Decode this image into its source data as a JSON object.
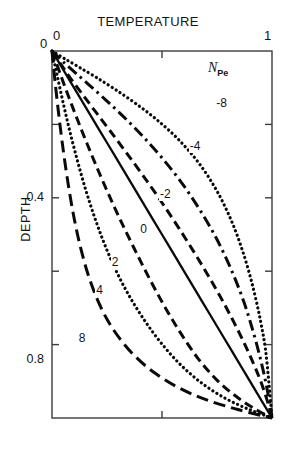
{
  "chart_data": {
    "type": "line",
    "title": "TEMPERATURE",
    "xlabel": "TEMPERATURE",
    "ylabel": "DEPTH",
    "xlim": [
      0,
      1
    ],
    "ylim": [
      0,
      1
    ],
    "x_ticks": [
      "0",
      "1"
    ],
    "x_tick_values": [
      0,
      1
    ],
    "x_minor_tick_values": [
      0.5
    ],
    "y_ticks": [
      "0",
      "0.4",
      "0.8"
    ],
    "y_tick_values": [
      0,
      0.4,
      0.8
    ],
    "y_minor_tick_values": [
      0.2,
      0.6,
      1.0
    ],
    "grid": false,
    "legend_position": "inline-curve-labels",
    "legend_title": "N",
    "legend_title_sub": "Pe",
    "axis_inverted_y": true,
    "note": "Dimensionless temperature vs depth for a range of Peclet numbers. All curves start at (0,0) and end at (1,1).",
    "series": [
      {
        "name": "-8",
        "peclet": -8,
        "label": "-8",
        "style": "dotted",
        "label_x": 0.76,
        "label_y": 0.145,
        "x": [
          0,
          0.055,
          0.12,
          0.196,
          0.283,
          0.378,
          0.478,
          0.578,
          0.672,
          0.754,
          0.822,
          0.876,
          0.917,
          0.948,
          0.97,
          0.986,
          1.0
        ],
        "y": [
          0,
          0.02,
          0.043,
          0.07,
          0.103,
          0.142,
          0.188,
          0.243,
          0.309,
          0.386,
          0.472,
          0.563,
          0.652,
          0.736,
          0.812,
          0.905,
          1.0
        ]
      },
      {
        "name": "-4",
        "peclet": -4,
        "label": "-4",
        "style": "dashdot",
        "label_x": 0.64,
        "label_y": 0.262,
        "x": [
          0,
          0.048,
          0.104,
          0.168,
          0.24,
          0.32,
          0.406,
          0.494,
          0.582,
          0.666,
          0.744,
          0.812,
          0.87,
          0.916,
          0.952,
          0.979,
          1.0
        ],
        "y": [
          0,
          0.028,
          0.058,
          0.092,
          0.131,
          0.176,
          0.228,
          0.287,
          0.353,
          0.427,
          0.507,
          0.592,
          0.68,
          0.768,
          0.85,
          0.925,
          1.0
        ]
      },
      {
        "name": "-2",
        "peclet": -2,
        "label": "-2",
        "style": "dashed",
        "label_x": 0.505,
        "label_y": 0.392,
        "x": [
          0,
          0.04,
          0.085,
          0.137,
          0.196,
          0.262,
          0.334,
          0.412,
          0.494,
          0.578,
          0.662,
          0.744,
          0.82,
          0.887,
          0.941,
          0.977,
          1.0
        ],
        "y": [
          0,
          0.036,
          0.075,
          0.117,
          0.164,
          0.216,
          0.274,
          0.338,
          0.408,
          0.484,
          0.564,
          0.647,
          0.731,
          0.813,
          0.888,
          0.95,
          1.0
        ]
      },
      {
        "name": "0",
        "peclet": 0,
        "label": "0",
        "style": "solid",
        "label_x": 0.415,
        "label_y": 0.487,
        "x": [
          0,
          0.0625,
          0.125,
          0.1875,
          0.25,
          0.3125,
          0.375,
          0.4375,
          0.5,
          0.5625,
          0.625,
          0.6875,
          0.75,
          0.8125,
          0.875,
          0.9375,
          1.0
        ],
        "y": [
          0,
          0.0625,
          0.125,
          0.1875,
          0.25,
          0.3125,
          0.375,
          0.4375,
          0.5,
          0.5625,
          0.625,
          0.6875,
          0.75,
          0.8125,
          0.875,
          0.9375,
          1.0
        ]
      },
      {
        "name": "2",
        "peclet": 2,
        "label": "2",
        "style": "dashed",
        "label_x": 0.285,
        "label_y": 0.577,
        "x": [
          0,
          0.036,
          0.074,
          0.115,
          0.159,
          0.206,
          0.257,
          0.312,
          0.372,
          0.436,
          0.506,
          0.582,
          0.664,
          0.752,
          0.845,
          0.93,
          1.0
        ],
        "y": [
          0,
          0.06,
          0.122,
          0.186,
          0.252,
          0.32,
          0.39,
          0.462,
          0.536,
          0.612,
          0.69,
          0.766,
          0.838,
          0.898,
          0.945,
          0.978,
          1.0
        ]
      },
      {
        "name": "4",
        "peclet": 4,
        "label": "4",
        "style": "dotted",
        "label_x": 0.215,
        "label_y": 0.655,
        "x": [
          0,
          0.026,
          0.054,
          0.084,
          0.117,
          0.153,
          0.193,
          0.238,
          0.289,
          0.348,
          0.416,
          0.494,
          0.583,
          0.683,
          0.79,
          0.897,
          1.0
        ],
        "y": [
          0,
          0.074,
          0.15,
          0.226,
          0.302,
          0.378,
          0.452,
          0.525,
          0.596,
          0.664,
          0.73,
          0.794,
          0.854,
          0.906,
          0.947,
          0.977,
          1.0
        ]
      },
      {
        "name": "8",
        "peclet": 8,
        "label": "8",
        "style": "longdash",
        "label_x": 0.135,
        "label_y": 0.785,
        "x": [
          0,
          0.016,
          0.034,
          0.054,
          0.076,
          0.101,
          0.13,
          0.164,
          0.204,
          0.252,
          0.311,
          0.383,
          0.471,
          0.577,
          0.7,
          0.845,
          1.0
        ],
        "y": [
          0,
          0.095,
          0.19,
          0.283,
          0.372,
          0.457,
          0.536,
          0.609,
          0.674,
          0.733,
          0.786,
          0.835,
          0.879,
          0.918,
          0.95,
          0.977,
          1.0
        ]
      }
    ]
  },
  "axis": {
    "x_origin_label": "0",
    "x_origin_left_label": "0",
    "x_max_label": "1",
    "y_tick_04": "0.4",
    "y_tick_08": "0.8",
    "y_axis_title": "DEPTH"
  },
  "colors": {
    "line": "#0a0a0a",
    "frame": "#3c3c3c",
    "text": "#141414",
    "background": "#ffffff"
  }
}
